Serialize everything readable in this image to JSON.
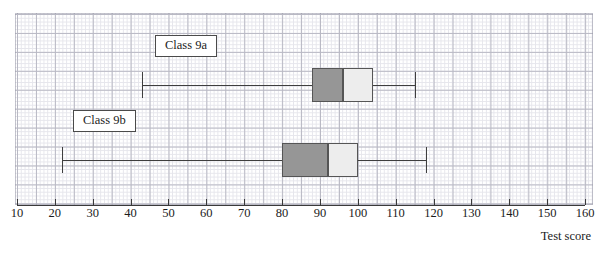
{
  "chart_data": {
    "type": "boxplot",
    "title": "",
    "xlabel": "Test score",
    "ylabel": "",
    "xlim": [
      10,
      160
    ],
    "xticks": [
      10,
      20,
      30,
      40,
      50,
      60,
      70,
      80,
      90,
      100,
      110,
      120,
      130,
      140,
      150,
      160
    ],
    "xtick_labels": [
      "10",
      "20",
      "30",
      "40",
      "50",
      "60",
      "70",
      "80",
      "90",
      "100",
      "110",
      "120",
      "130",
      "140",
      "150",
      "160"
    ],
    "grid": true,
    "grid_style": "graph-paper",
    "legend": "inline-callout-labels",
    "orientation": "horizontal",
    "colors": {
      "lower_quartile_box": "#969696",
      "upper_quartile_box": "#ededed",
      "box_outline": "#555555",
      "whisker": "#3e3e3e",
      "axis": "#3a3a3a",
      "grid_minor": "#e6e6ec",
      "grid_major": "#b9b9c4",
      "background": "#ffffff"
    },
    "series": [
      {
        "name": "Class 9a",
        "label": "Class 9a",
        "minimum": 43,
        "lower_quartile": 88,
        "median": 96,
        "upper_quartile": 104,
        "maximum": 115,
        "interquartile_range": 16,
        "range": 72
      },
      {
        "name": "Class 9b",
        "label": "Class 9b",
        "minimum": 22,
        "lower_quartile": 80,
        "median": 92,
        "upper_quartile": 100,
        "maximum": 118,
        "interquartile_range": 20,
        "range": 96
      }
    ]
  },
  "axis": {
    "caption": "Test score"
  }
}
